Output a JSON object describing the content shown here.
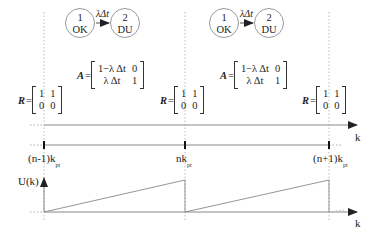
{
  "diagram": {
    "title": "",
    "states": [
      {
        "id": "1",
        "label": "OK"
      },
      {
        "id": "2",
        "label": "DU"
      }
    ],
    "transition_rate": "λΔt",
    "A_matrix": {
      "name": "A",
      "rows": [
        [
          "1−λ Δt",
          "0"
        ],
        [
          "λ Δt",
          "1"
        ]
      ]
    },
    "R_matrix": {
      "name": "R",
      "rows": [
        [
          "1",
          "1"
        ],
        [
          "0",
          "0"
        ]
      ]
    },
    "axes": {
      "k_label": "k",
      "u_label": "U(k)",
      "ticks": [
        "(n-1)k",
        "nk",
        "(n+1)k"
      ],
      "tick_subscript": "pt"
    },
    "colors": {
      "line": "#888888",
      "text": "#222222"
    }
  }
}
